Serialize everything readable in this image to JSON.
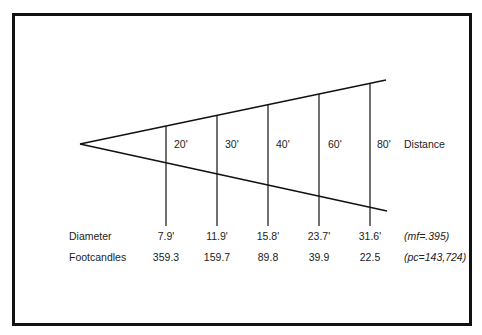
{
  "diagram": {
    "type": "light-cone",
    "apex": {
      "x": 80,
      "y": 144
    },
    "distance_label": "Distance",
    "stations": [
      {
        "distance": "20'",
        "diameter": "7.9'",
        "footcandles": "359.3"
      },
      {
        "distance": "30'",
        "diameter": "11.9'",
        "footcandles": "159.7"
      },
      {
        "distance": "40'",
        "diameter": "15.8'",
        "footcandles": "89.8"
      },
      {
        "distance": "60'",
        "diameter": "23.7'",
        "footcandles": "39.9"
      },
      {
        "distance": "80'",
        "diameter": "31.6'",
        "footcandles": "22.5"
      }
    ],
    "rows": {
      "diameter_label": "Diameter",
      "footcandles_label": "Footcandles",
      "diameter_note": "(mf=.395)",
      "footcandles_note": "(pc=143,724)"
    },
    "colors": {
      "line": "#111111",
      "text": "#222222",
      "background": "#ffffff"
    }
  }
}
